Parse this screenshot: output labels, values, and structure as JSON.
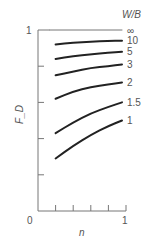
{
  "chart_data": {
    "type": "line",
    "title": "",
    "xlabel": "n",
    "ylabel": "F_D",
    "xlim": [
      0,
      1
    ],
    "ylim": [
      0,
      1
    ],
    "x_tick_labels": [
      "0",
      "1"
    ],
    "y_tick_labels": [
      "1"
    ],
    "x_ticks": [
      0.2,
      0.4,
      0.6,
      0.8,
      1.0
    ],
    "y_ticks": [
      0.2,
      0.4,
      0.6,
      0.8,
      1.0
    ],
    "legend_title": "W/B",
    "legend_placement": "right (curve-end labels)",
    "series": [
      {
        "name": "∞",
        "x": [
          0.0,
          1.0
        ],
        "y": [
          1.0,
          1.0
        ]
      },
      {
        "name": "10",
        "x": [
          0.2,
          0.4,
          0.6,
          0.8,
          1.0
        ],
        "y": [
          0.92,
          0.93,
          0.935,
          0.94,
          0.94
        ]
      },
      {
        "name": "5",
        "x": [
          0.2,
          0.4,
          0.6,
          0.8,
          1.0
        ],
        "y": [
          0.84,
          0.855,
          0.865,
          0.875,
          0.88
        ]
      },
      {
        "name": "3",
        "x": [
          0.2,
          0.4,
          0.6,
          0.8,
          1.0
        ],
        "y": [
          0.75,
          0.77,
          0.79,
          0.8,
          0.81
        ]
      },
      {
        "name": "2",
        "x": [
          0.2,
          0.4,
          0.6,
          0.8,
          1.0
        ],
        "y": [
          0.62,
          0.66,
          0.685,
          0.7,
          0.71
        ]
      },
      {
        "name": "1.5",
        "x": [
          0.2,
          0.4,
          0.6,
          0.8,
          1.0
        ],
        "y": [
          0.43,
          0.49,
          0.54,
          0.575,
          0.6
        ]
      },
      {
        "name": "1",
        "x": [
          0.2,
          0.4,
          0.6,
          0.8,
          1.0
        ],
        "y": [
          0.29,
          0.36,
          0.42,
          0.47,
          0.5
        ]
      }
    ]
  }
}
